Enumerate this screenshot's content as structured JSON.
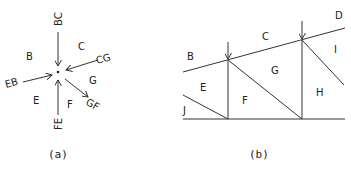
{
  "panel_a": {
    "caption": "(a)",
    "region_labels": {
      "B": "B",
      "C": "C",
      "E": "E",
      "F": "F",
      "G": "G"
    },
    "force_labels": {
      "BC": "BC",
      "CG": "CG",
      "GF": "GF",
      "FE": "FE",
      "EB": "EB"
    }
  },
  "panel_b": {
    "caption": "(b)",
    "region_labels": {
      "B": "B",
      "C": "C",
      "D": "D",
      "E": "E",
      "F": "F",
      "G": "G",
      "H": "H",
      "I": "I",
      "J": "J"
    }
  },
  "colors": {
    "line": "#333333",
    "text": "#222222",
    "background": "#ffffff"
  }
}
